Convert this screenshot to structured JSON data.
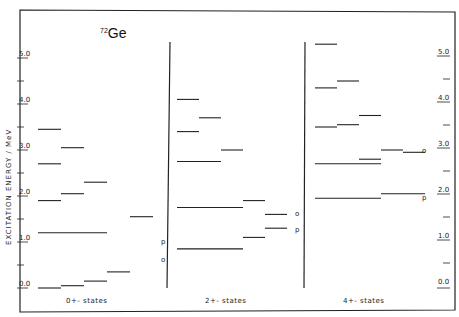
{
  "chart_data": {
    "type": "level-diagram",
    "title": "72Ge",
    "title_mass": "72",
    "title_element": "Ge",
    "ylabel": "EXCITATION  ENERGY / MeV",
    "ylim": [
      -0.2,
      5.4
    ],
    "yticks": [
      "0.0",
      "1.0",
      "2.0",
      "3.0",
      "4.0",
      "5.0"
    ],
    "panels": [
      {
        "label": "0+-states",
        "levels": [
          {
            "cols": [
              0,
              1
            ],
            "e": 0.0
          },
          {
            "cols": [
              1,
              2
            ],
            "e": 0.05
          },
          {
            "cols": [
              2,
              3
            ],
            "e": 0.15
          },
          {
            "cols": [
              3,
              4
            ],
            "e": 0.35
          },
          {
            "cols": [
              0,
              3
            ],
            "e": 1.2
          },
          {
            "cols": [
              4,
              5
            ],
            "e": 1.55
          },
          {
            "cols": [
              0,
              1
            ],
            "e": 1.9
          },
          {
            "cols": [
              1,
              2
            ],
            "e": 2.05
          },
          {
            "cols": [
              2,
              3
            ],
            "e": 2.3
          },
          {
            "cols": [
              0,
              1
            ],
            "e": 2.7
          },
          {
            "cols": [
              1,
              2
            ],
            "e": 3.05
          },
          {
            "cols": [
              0,
              1
            ],
            "e": 3.45
          }
        ],
        "annotations": [
          {
            "text": "p",
            "e": 0.9,
            "col": 5
          },
          {
            "text": "o",
            "e": 0.75,
            "col": 5
          }
        ]
      },
      {
        "label": "2+-states",
        "levels": [
          {
            "cols": [
              0,
              3
            ],
            "e": 0.85
          },
          {
            "cols": [
              3,
              4
            ],
            "e": 1.1
          },
          {
            "cols": [
              4,
              5
            ],
            "e": 1.3
          },
          {
            "cols": [
              0,
              3
            ],
            "e": 1.75
          },
          {
            "cols": [
              3,
              4
            ],
            "e": 1.9
          },
          {
            "cols": [
              4,
              5
            ],
            "e": 1.6
          },
          {
            "cols": [
              0,
              2
            ],
            "e": 2.75
          },
          {
            "cols": [
              2,
              3
            ],
            "e": 3.0
          },
          {
            "cols": [
              0,
              1
            ],
            "e": 3.4
          },
          {
            "cols": [
              1,
              2
            ],
            "e": 3.7
          },
          {
            "cols": [
              0,
              1
            ],
            "e": 4.1
          }
        ],
        "annotations": [
          {
            "text": "o",
            "e": 1.75,
            "col": 5
          },
          {
            "text": "p",
            "e": 1.15,
            "col": 5
          }
        ]
      },
      {
        "label": "4+-states",
        "levels": [
          {
            "cols": [
              0,
              3
            ],
            "e": 1.95
          },
          {
            "cols": [
              3,
              5
            ],
            "e": 2.05
          },
          {
            "cols": [
              0,
              3
            ],
            "e": 2.7
          },
          {
            "cols": [
              2,
              3
            ],
            "e": 2.8
          },
          {
            "cols": [
              3,
              4
            ],
            "e": 3.0
          },
          {
            "cols": [
              4,
              5
            ],
            "e": 2.95
          },
          {
            "cols": [
              0,
              1
            ],
            "e": 3.5
          },
          {
            "cols": [
              1,
              2
            ],
            "e": 3.55
          },
          {
            "cols": [
              2,
              3
            ],
            "e": 3.75
          },
          {
            "cols": [
              0,
              1
            ],
            "e": 4.35
          },
          {
            "cols": [
              1,
              2
            ],
            "e": 4.5
          },
          {
            "cols": [
              0,
              1
            ],
            "e": 5.3
          }
        ],
        "annotations": [
          {
            "text": "o",
            "e": 3.1,
            "col": 4.5
          },
          {
            "text": "p",
            "e": 1.85,
            "col": 4.5
          }
        ]
      }
    ]
  },
  "axis_labels": {
    "left": [
      "0.0",
      "1.0",
      "2.0",
      "3.0",
      "4.0",
      "5.0"
    ],
    "right": [
      "0.0",
      "1.0",
      "2.0",
      "3.0",
      "4.0",
      "5.0"
    ]
  },
  "panel_labels": [
    "0+- states",
    "2+- states",
    "4+- states"
  ]
}
